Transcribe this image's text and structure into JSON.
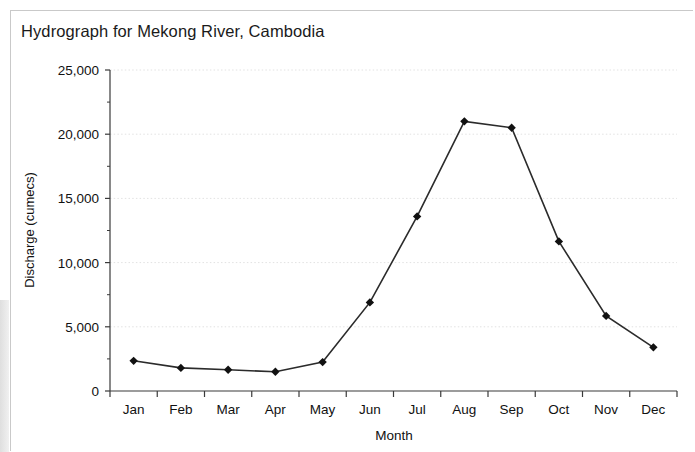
{
  "figure": {
    "title": "Hydrograph for Mekong River, Cambodia"
  },
  "chart_data": {
    "type": "line",
    "title": "Hydrograph for Mekong River, Cambodia",
    "xlabel": "Month",
    "ylabel": "Discharge (cumecs)",
    "categories": [
      "Jan",
      "Feb",
      "Mar",
      "Apr",
      "May",
      "Jun",
      "Jul",
      "Aug",
      "Sep",
      "Oct",
      "Nov",
      "Dec"
    ],
    "values": [
      2350,
      1800,
      1650,
      1500,
      2250,
      6900,
      13600,
      21000,
      20500,
      11650,
      5850,
      3400
    ],
    "ylim": [
      0,
      25000
    ],
    "ytick_labels": [
      "0",
      "5,000",
      "10,000",
      "15,000",
      "20,000",
      "25,000"
    ],
    "ytick_values": [
      0,
      5000,
      10000,
      15000,
      20000,
      25000
    ],
    "yminor_step": 2500,
    "grid": "horizontal-dotted",
    "legend": "none",
    "series": [
      {
        "name": "Discharge",
        "marker": "diamond",
        "marker_color": "#111111",
        "line_color": "#2b2b2b",
        "values": [
          2350,
          1800,
          1650,
          1500,
          2250,
          6900,
          13600,
          21000,
          20500,
          11650,
          5850,
          3400
        ]
      }
    ]
  },
  "colors": {
    "line": "#2b2b2b",
    "marker": "#111111",
    "axis": "#3a3a3a",
    "grid": "#e2e2e2",
    "text": "#111111",
    "frame": "#c9c9c9"
  }
}
